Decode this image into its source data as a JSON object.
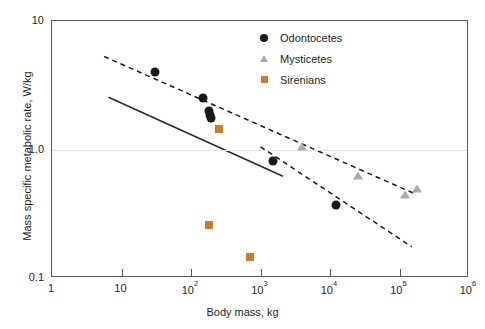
{
  "chart_data": {
    "type": "scatter",
    "title": "",
    "xlabel": "Body mass, kg",
    "ylabel": "Mass specific metabolic rate, W/kg",
    "xscale": "log",
    "yscale": "log",
    "xlim": [
      1,
      1000000
    ],
    "ylim": [
      0.1,
      10
    ],
    "xticks": [
      1,
      10,
      100,
      1000,
      10000,
      100000,
      1000000
    ],
    "xtick_labels": [
      "1",
      "10",
      "10²",
      "10³",
      "10⁴",
      "10⁵",
      "10⁶"
    ],
    "yticks": [
      0.1,
      1.0,
      10
    ],
    "ytick_labels": [
      "0.1",
      "1.0",
      "10"
    ],
    "grid": "horizontal gridline at y = 1.0 only",
    "legend_position": "top-right inside axes",
    "series": [
      {
        "name": "Odontocetes",
        "marker": "circle",
        "color": "#1a1a1a",
        "points": [
          {
            "x": 30,
            "y": 4.0
          },
          {
            "x": 150,
            "y": 2.5
          },
          {
            "x": 180,
            "y": 2.0
          },
          {
            "x": 190,
            "y": 1.85
          },
          {
            "x": 195,
            "y": 1.75
          },
          {
            "x": 1500,
            "y": 0.82
          },
          {
            "x": 12000,
            "y": 0.37
          }
        ]
      },
      {
        "name": "Mysticetes",
        "marker": "triangle",
        "color": "#a7a9ac",
        "points": [
          {
            "x": 4000,
            "y": 1.05
          },
          {
            "x": 25000,
            "y": 0.62
          },
          {
            "x": 120000,
            "y": 0.44
          },
          {
            "x": 180000,
            "y": 0.49
          }
        ]
      },
      {
        "name": "Sirenians",
        "marker": "square",
        "color": "#d2762a",
        "points": [
          {
            "x": 250,
            "y": 1.45
          },
          {
            "x": 180,
            "y": 0.26
          },
          {
            "x": 700,
            "y": 0.145
          }
        ]
      }
    ],
    "fit_lines": [
      {
        "name": "solid-regression-line",
        "style": "solid",
        "color": "#2b2b2b",
        "x0": 6.5,
        "y0": 2.55,
        "x1": 2100,
        "y1": 0.62
      },
      {
        "name": "upper-dashed-bound",
        "style": "dashed",
        "color": "#1a1a1a",
        "x0": 5.6,
        "y0": 5.3,
        "x1": 170000,
        "y1": 0.45
      },
      {
        "name": "lower-dashed-bound",
        "style": "dashed",
        "color": "#1a1a1a",
        "x0": 1000,
        "y0": 1.05,
        "x1": 150000,
        "y1": 0.175
      }
    ]
  },
  "axes": {
    "x_title": "Body mass, kg",
    "y_title": "Mass specific metabolic rate, W/kg",
    "x_tick_labels": [
      "1",
      "10",
      "10",
      "10",
      "10",
      "10",
      "10"
    ],
    "x_tick_exponents": [
      "",
      "",
      "2",
      "3",
      "4",
      "5",
      "6"
    ],
    "y_tick_labels": [
      "10",
      "1.0",
      "0.1"
    ]
  },
  "legend": {
    "items": [
      {
        "label": "Odontocetes",
        "marker": "circle",
        "color": "#1a1a1a"
      },
      {
        "label": "Mysticetes",
        "marker": "triangle",
        "color": "#a7a9ac"
      },
      {
        "label": "Sirenians",
        "marker": "square",
        "color": "#d2762a"
      }
    ]
  },
  "colors": {
    "odontocetes": "#1a1a1a",
    "mysticetes": "#a7a9ac",
    "sirenians": "#d2762a",
    "frame": "#58595b",
    "gridline": "#e3e3e5",
    "text": "#231f20"
  }
}
